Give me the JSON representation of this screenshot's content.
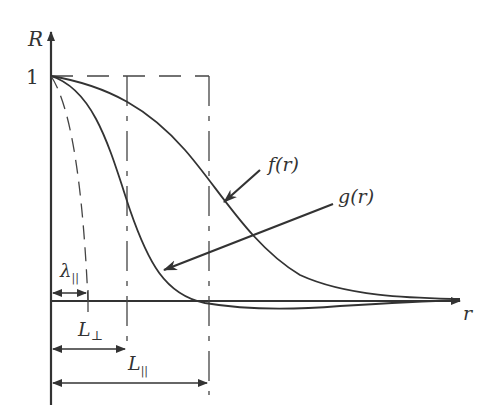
{
  "diagram": {
    "type": "correlation-function-sketch",
    "axes": {
      "y_label": "R",
      "x_label": "r",
      "y_tick": "1"
    },
    "curves": [
      {
        "id": "f",
        "label": "f(r)",
        "description": "longitudinal correlation, decays slowly to 0"
      },
      {
        "id": "g",
        "label": "g(r)",
        "description": "transverse correlation, goes slightly negative"
      },
      {
        "id": "osc-parabola",
        "label": "",
        "description": "dashed osculating parabola defining Taylor microscale"
      }
    ],
    "length_scales": [
      {
        "label": "λ",
        "subscript": "||",
        "description": "Taylor microscale"
      },
      {
        "label": "L",
        "subscript": "⊥",
        "description": "transverse integral scale"
      },
      {
        "label": "L",
        "subscript": "||",
        "description": "longitudinal integral scale"
      }
    ],
    "colors": {
      "ink": "#333333",
      "background": "#ffffff"
    }
  }
}
